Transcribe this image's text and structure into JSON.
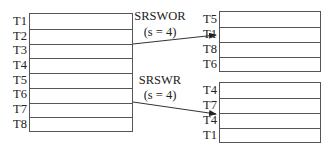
{
  "population": {
    "labels": [
      "T1",
      "T2",
      "T3",
      "T4",
      "T5",
      "T6",
      "T7",
      "T8"
    ]
  },
  "srswor": {
    "name": "SRSWOR",
    "param": "(s = 4)",
    "labels": [
      "T5",
      "T1",
      "T8",
      "T6"
    ]
  },
  "srswr": {
    "name": "SRSWR",
    "param": "(s = 4)",
    "labels": [
      "T4",
      "T7",
      "T4",
      "T1"
    ]
  },
  "colors": {
    "line": "#555555",
    "text": "#222222",
    "background": "#ffffff"
  }
}
